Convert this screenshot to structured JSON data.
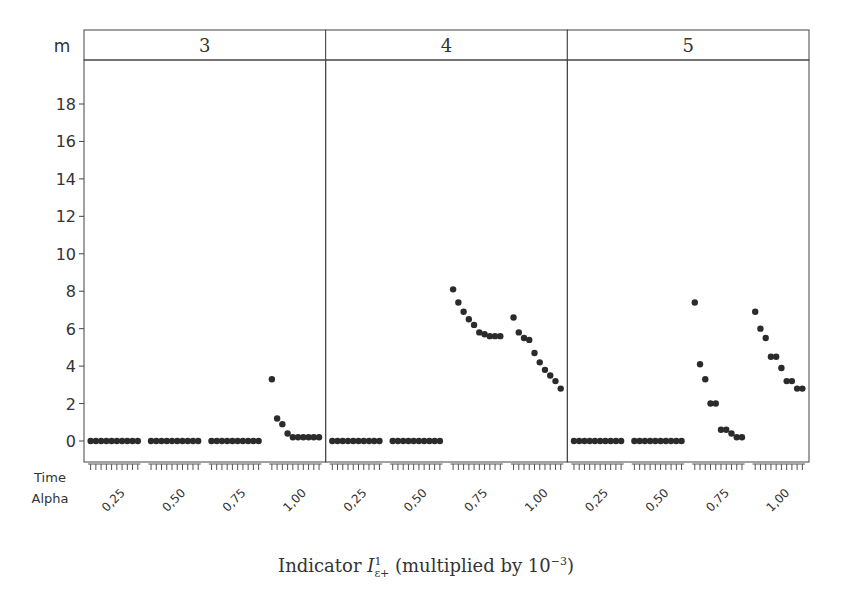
{
  "chart_data": {
    "type": "scatter",
    "facet_label": "m",
    "panels": [
      {
        "m": "3",
        "groups": [
          {
            "alpha": "0,25",
            "values": [
              0,
              0,
              0,
              0,
              0,
              0,
              0,
              0,
              0,
              0
            ]
          },
          {
            "alpha": "0,50",
            "values": [
              0,
              0,
              0,
              0,
              0,
              0,
              0,
              0,
              0,
              0
            ]
          },
          {
            "alpha": "0,75",
            "values": [
              0,
              0,
              0,
              0,
              0,
              0,
              0,
              0,
              0,
              0
            ]
          },
          {
            "alpha": "1,00",
            "values": [
              3.3,
              1.2,
              0.9,
              0.4,
              0.2,
              0.2,
              0.2,
              0.2,
              0.2,
              0.2
            ]
          }
        ]
      },
      {
        "m": "4",
        "groups": [
          {
            "alpha": "0,25",
            "values": [
              0,
              0,
              0,
              0,
              0,
              0,
              0,
              0,
              0,
              0
            ]
          },
          {
            "alpha": "0,50",
            "values": [
              0,
              0,
              0,
              0,
              0,
              0,
              0,
              0,
              0,
              0
            ]
          },
          {
            "alpha": "0,75",
            "values": [
              8.1,
              7.4,
              6.9,
              6.5,
              6.2,
              5.8,
              5.7,
              5.6,
              5.6,
              5.6
            ]
          },
          {
            "alpha": "1,00",
            "values": [
              6.6,
              5.8,
              5.5,
              5.4,
              4.7,
              4.2,
              3.8,
              3.5,
              3.2,
              2.8
            ]
          }
        ]
      },
      {
        "m": "5",
        "groups": [
          {
            "alpha": "0,25",
            "values": [
              0,
              0,
              0,
              0,
              0,
              0,
              0,
              0,
              0,
              0
            ]
          },
          {
            "alpha": "0,50",
            "values": [
              0,
              0,
              0,
              0,
              0,
              0,
              0,
              0,
              0,
              0
            ]
          },
          {
            "alpha": "0,75",
            "values": [
              7.4,
              4.1,
              3.3,
              2.0,
              2.0,
              0.6,
              0.6,
              0.4,
              0.2,
              0.2
            ]
          },
          {
            "alpha": "1,00",
            "values": [
              6.9,
              6.0,
              5.5,
              4.5,
              4.5,
              3.9,
              3.2,
              3.2,
              2.8,
              2.8
            ]
          }
        ]
      }
    ],
    "y_ticks": [
      0,
      2,
      4,
      6,
      8,
      10,
      12,
      14,
      16,
      18
    ],
    "ylim": [
      -1.2,
      19.5
    ],
    "x_axis_rows": [
      "Time",
      "Alpha"
    ],
    "x_tick_labels": [
      "0,25",
      "0,50",
      "0,75",
      "1,00"
    ],
    "xlabel": "Indicator I^1_{ε+} (multiplied by 10^-3)",
    "legend": null,
    "grid": false,
    "point_color": "#2b2b2b"
  },
  "labels": {
    "facet": "m",
    "row_time": "Time",
    "row_alpha": "Alpha",
    "xlabel_prefix": "Indicator ",
    "xlabel_I": "I",
    "xlabel_sup": "1",
    "xlabel_sub": "ε+",
    "xlabel_suffix": " (multiplied by 10",
    "xlabel_exp": "−3",
    "xlabel_close": ")"
  }
}
